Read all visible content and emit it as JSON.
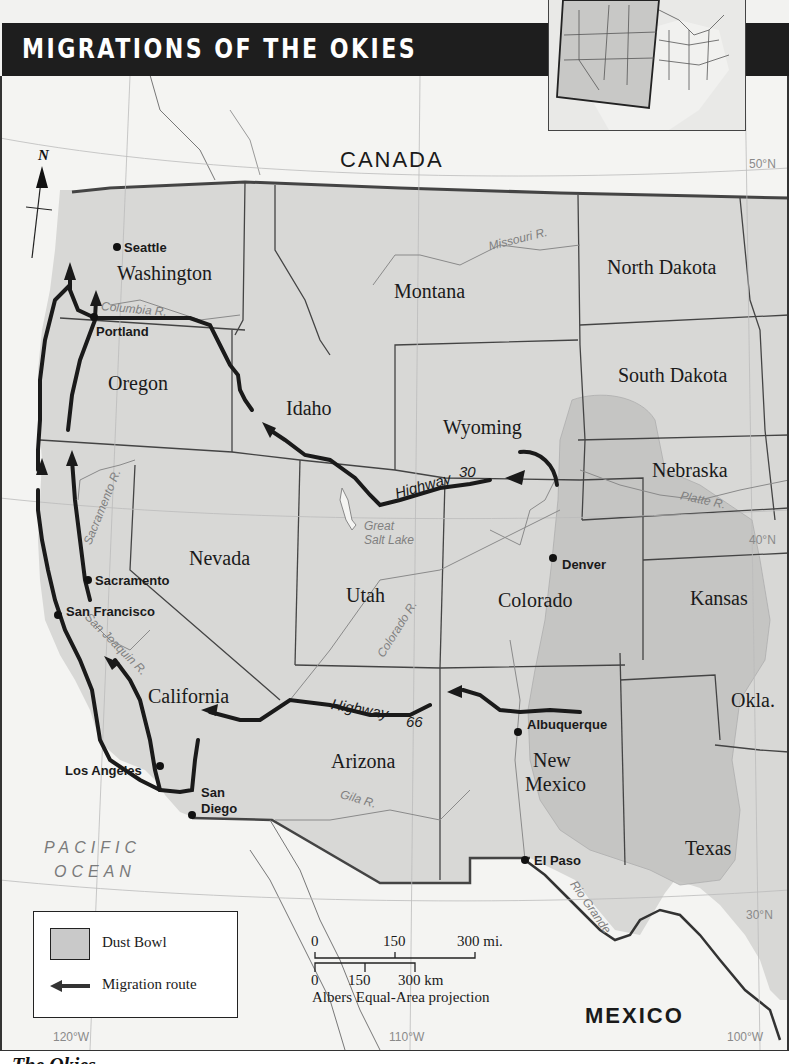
{
  "title": "MIGRATIONS OF THE OKIES",
  "countries": {
    "canada": "CANADA",
    "mexico": "MEXICO"
  },
  "ocean": {
    "line1": "PACIFIC",
    "line2": "OCEAN"
  },
  "states": {
    "washington": "Washington",
    "oregon": "Oregon",
    "idaho": "Idaho",
    "montana": "Montana",
    "wyoming": "Wyoming",
    "north_dakota": "North Dakota",
    "south_dakota": "South Dakota",
    "nebraska": "Nebraska",
    "nevada": "Nevada",
    "utah": "Utah",
    "colorado": "Colorado",
    "kansas": "Kansas",
    "california": "California",
    "arizona": "Arizona",
    "new_mexico_1": "New",
    "new_mexico_2": "Mexico",
    "oklahoma": "Okla.",
    "texas": "Texas"
  },
  "cities": {
    "seattle": "Seattle",
    "portland": "Portland",
    "sacramento": "Sacramento",
    "san_francisco": "San Francisco",
    "los_angeles": "Los Angeles",
    "san_diego_1": "San",
    "san_diego_2": "Diego",
    "denver": "Denver",
    "albuquerque": "Albuquerque",
    "el_paso": "El Paso"
  },
  "rivers": {
    "missouri": "Missouri R.",
    "columbia": "Columbia R.",
    "sacramento": "Sacramento R.",
    "san_joaquin": "San Joaquin R.",
    "colorado": "Colorado R.",
    "platte": "Platte R.",
    "gila": "Gila R.",
    "rio_grande": "Rio Grande",
    "great_salt_lake_1": "Great",
    "great_salt_lake_2": "Salt Lake"
  },
  "highways": {
    "hwy30_word": "Highway",
    "hwy30_num": "30",
    "hwy66_word": "Highway",
    "hwy66_num": "66"
  },
  "gridlines": {
    "lat50": "50°N",
    "lat40": "40°N",
    "lat30": "30°N",
    "lon120": "120°W",
    "lon110": "110°W",
    "lon100": "100°W"
  },
  "north_arrow": "N",
  "legend": {
    "dust_bowl": "Dust Bowl",
    "migration_route": "Migration route"
  },
  "scale": {
    "mi_0": "0",
    "mi_150": "150",
    "mi_300": "300 mi.",
    "km_0": "0",
    "km_150": "150",
    "km_300": "300 km",
    "projection": "Albers Equal-Area projection"
  },
  "caption": "The Okies",
  "colors": {
    "title_bar": "#1e1e1e",
    "us_land": "#d6d6d4",
    "foreign_land": "#f4f4f2",
    "dust_bowl": "#c3c3c1",
    "route": "#1a1a1a",
    "river": "#8a8a8a"
  }
}
